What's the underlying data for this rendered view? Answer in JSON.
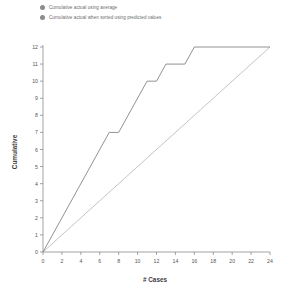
{
  "legend": {
    "position": "top-left",
    "marker_color": "#8c8c8c",
    "items": [
      {
        "label": "Cumulative actual using average",
        "color": "#b0b0b0"
      },
      {
        "label": "Cumulative actual when sorted using predicted values",
        "color": "#6e6e6e"
      }
    ]
  },
  "chart_data": {
    "type": "line",
    "title": "",
    "xlabel": "# Cases",
    "ylabel": "Cumulative",
    "xlim": [
      0,
      24
    ],
    "ylim": [
      0,
      12
    ],
    "xticks": [
      0,
      2,
      4,
      6,
      8,
      10,
      12,
      14,
      16,
      18,
      20,
      22,
      24
    ],
    "yticks": [
      0,
      1,
      2,
      3,
      4,
      5,
      6,
      7,
      8,
      9,
      10,
      11,
      12
    ],
    "grid": false,
    "series": [
      {
        "name": "Cumulative actual using average",
        "color": "#b0b0b0",
        "style": "straight-diagonal",
        "x": [
          0,
          24
        ],
        "y": [
          0,
          12
        ]
      },
      {
        "name": "Cumulative actual when sorted using predicted values",
        "color": "#6e6e6e",
        "style": "step-curve",
        "x": [
          0,
          7,
          8,
          11,
          12,
          13,
          15,
          16,
          24
        ],
        "y": [
          0,
          7,
          7,
          10,
          10,
          11,
          11,
          12,
          12
        ]
      }
    ]
  }
}
